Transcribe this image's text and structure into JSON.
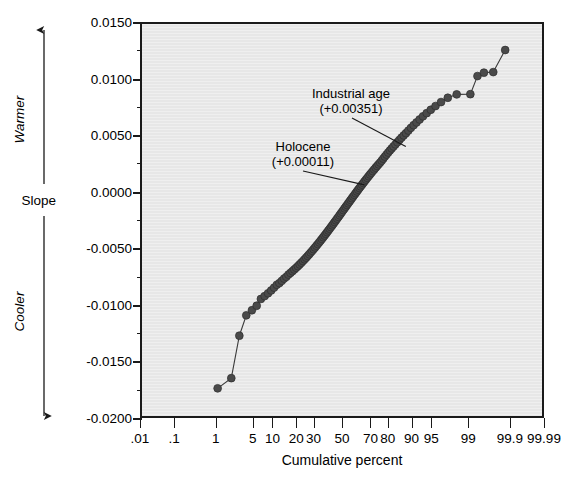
{
  "axes": {
    "y": {
      "label_top": "Warmer",
      "label_mid": "Slope",
      "label_bottom": "Cooler",
      "ticks": [
        "0.0150",
        "0.0100",
        "0.0050",
        "0.0000",
        "-0.0050",
        "-0.0100",
        "-0.0150",
        "-0.0200"
      ]
    },
    "x": {
      "title": "Cumulative percent",
      "ticks": [
        ".01",
        ".1",
        "1",
        "5",
        "10",
        "20",
        "30",
        "50",
        "70",
        "80",
        "90",
        "95",
        "99",
        "99.9",
        "99.99"
      ]
    }
  },
  "annotations": {
    "industrial": {
      "name": "Industrial age",
      "value": "(+0.00351)"
    },
    "holocene": {
      "name": "Holocene",
      "value": "(+0.00011)"
    }
  },
  "colors": {
    "plot_background": "#e7e7e7",
    "marker": "#4a4a4a",
    "axis": "#1a1a1a",
    "line": "#3a3a3a"
  },
  "chart_data": {
    "type": "scatter",
    "title": "",
    "subtitle": "",
    "xlabel": "Cumulative percent",
    "ylabel": "Slope",
    "xscale": "normal-probability",
    "grid": false,
    "legend": null,
    "ylim": [
      -0.02,
      0.015
    ],
    "ytick_values": [
      0.015,
      0.01,
      0.005,
      0.0,
      -0.005,
      -0.01,
      -0.015,
      -0.02
    ],
    "ytick_labels": [
      "0.0150",
      "0.0100",
      "0.0050",
      "0.0000",
      "-0.0050",
      "-0.0100",
      "-0.0150",
      "-0.0200"
    ],
    "yminor_step": 0.0025,
    "xtick_values": [
      0.01,
      0.1,
      1,
      5,
      10,
      20,
      30,
      50,
      70,
      80,
      90,
      95,
      99,
      99.9,
      99.99
    ],
    "xtick_labels": [
      ".01",
      ".1",
      "1",
      "5",
      "10",
      "20",
      "30",
      "50",
      "70",
      "80",
      "90",
      "95",
      "99",
      "99.9",
      "99.99"
    ],
    "marker_style": "filled-circle",
    "connected": true,
    "series": [
      {
        "name": "Slope quantiles",
        "x": [
          1.0,
          1.9,
          2.7,
          3.6,
          4.5,
          5.4,
          6.3,
          7.2,
          8.1,
          9.0,
          9.9,
          10.8,
          11.7,
          12.6,
          13.5,
          14.4,
          15.3,
          16.2,
          17.1,
          18.0,
          18.9,
          19.8,
          20.7,
          21.6,
          22.5,
          23.4,
          24.3,
          25.2,
          26.1,
          27.0,
          27.9,
          28.8,
          29.7,
          30.6,
          31.5,
          32.4,
          33.3,
          34.2,
          35.1,
          36.0,
          36.9,
          37.8,
          38.7,
          39.6,
          40.5,
          41.4,
          42.3,
          43.2,
          44.1,
          45.0,
          45.9,
          46.8,
          47.7,
          48.6,
          49.5,
          50.4,
          51.3,
          52.2,
          53.1,
          54.0,
          54.9,
          55.8,
          56.7,
          57.6,
          58.5,
          59.4,
          60.3,
          61.2,
          62.1,
          63.0,
          63.9,
          64.8,
          65.7,
          66.6,
          67.5,
          68.4,
          69.3,
          70.2,
          71.1,
          72.0,
          72.9,
          73.8,
          74.7,
          75.6,
          76.5,
          77.4,
          78.3,
          79.2,
          80.1,
          81.0,
          81.9,
          82.8,
          83.7,
          84.6,
          85.5,
          86.4,
          87.3,
          88.2,
          89.1,
          90.0,
          90.9,
          91.8,
          92.7,
          93.6,
          94.5,
          95.4,
          96.3,
          97.2,
          98.1,
          99.0,
          99.3,
          99.5,
          99.7,
          99.85
        ],
        "y": [
          -0.0172,
          -0.0163,
          -0.01255,
          -0.01075,
          -0.0103,
          -0.0099,
          -0.0093,
          -0.00905,
          -0.0088,
          -0.00855,
          -0.0083,
          -0.00805,
          -0.0079,
          -0.0077,
          -0.0075,
          -0.00735,
          -0.00715,
          -0.007,
          -0.00685,
          -0.0067,
          -0.00655,
          -0.0064,
          -0.00625,
          -0.0061,
          -0.00595,
          -0.0058,
          -0.00565,
          -0.0055,
          -0.00535,
          -0.0052,
          -0.00505,
          -0.0049,
          -0.00475,
          -0.0046,
          -0.00445,
          -0.0043,
          -0.00415,
          -0.004,
          -0.00385,
          -0.0037,
          -0.00355,
          -0.0034,
          -0.00325,
          -0.0031,
          -0.00295,
          -0.0028,
          -0.00265,
          -0.0025,
          -0.00235,
          -0.0022,
          -0.00205,
          -0.0019,
          -0.00175,
          -0.0016,
          -0.00145,
          -0.0013,
          -0.00115,
          -0.001,
          -0.00085,
          -0.0007,
          -0.00055,
          -0.0004,
          -0.00025,
          -0.0001,
          5e-05,
          0.0002,
          0.00035,
          0.0005,
          0.00065,
          0.0008,
          0.00095,
          0.0011,
          0.00125,
          0.0014,
          0.00155,
          0.0017,
          0.00185,
          0.002,
          0.00215,
          0.0023,
          0.00245,
          0.0026,
          0.00275,
          0.00292,
          0.0031,
          0.00328,
          0.00346,
          0.00364,
          0.00382,
          0.004,
          0.00418,
          0.00436,
          0.00455,
          0.00475,
          0.00495,
          0.00515,
          0.00535,
          0.00558,
          0.00582,
          0.00606,
          0.0063,
          0.00656,
          0.00684,
          0.00712,
          0.00742,
          0.00775,
          0.0081,
          0.00848,
          0.00878,
          0.0088,
          0.0104,
          0.0107,
          0.01075,
          0.0127
        ]
      }
    ],
    "annotations": [
      {
        "label": "Industrial age",
        "value_text": "(+0.00351)",
        "value": 0.00351,
        "points_to_x": 88.0,
        "points_to_y": 0.004
      },
      {
        "label": "Holocene",
        "value_text": "(+0.00011)",
        "value": 0.00011,
        "points_to_x": 66.0,
        "points_to_y": 0.0006
      }
    ]
  }
}
